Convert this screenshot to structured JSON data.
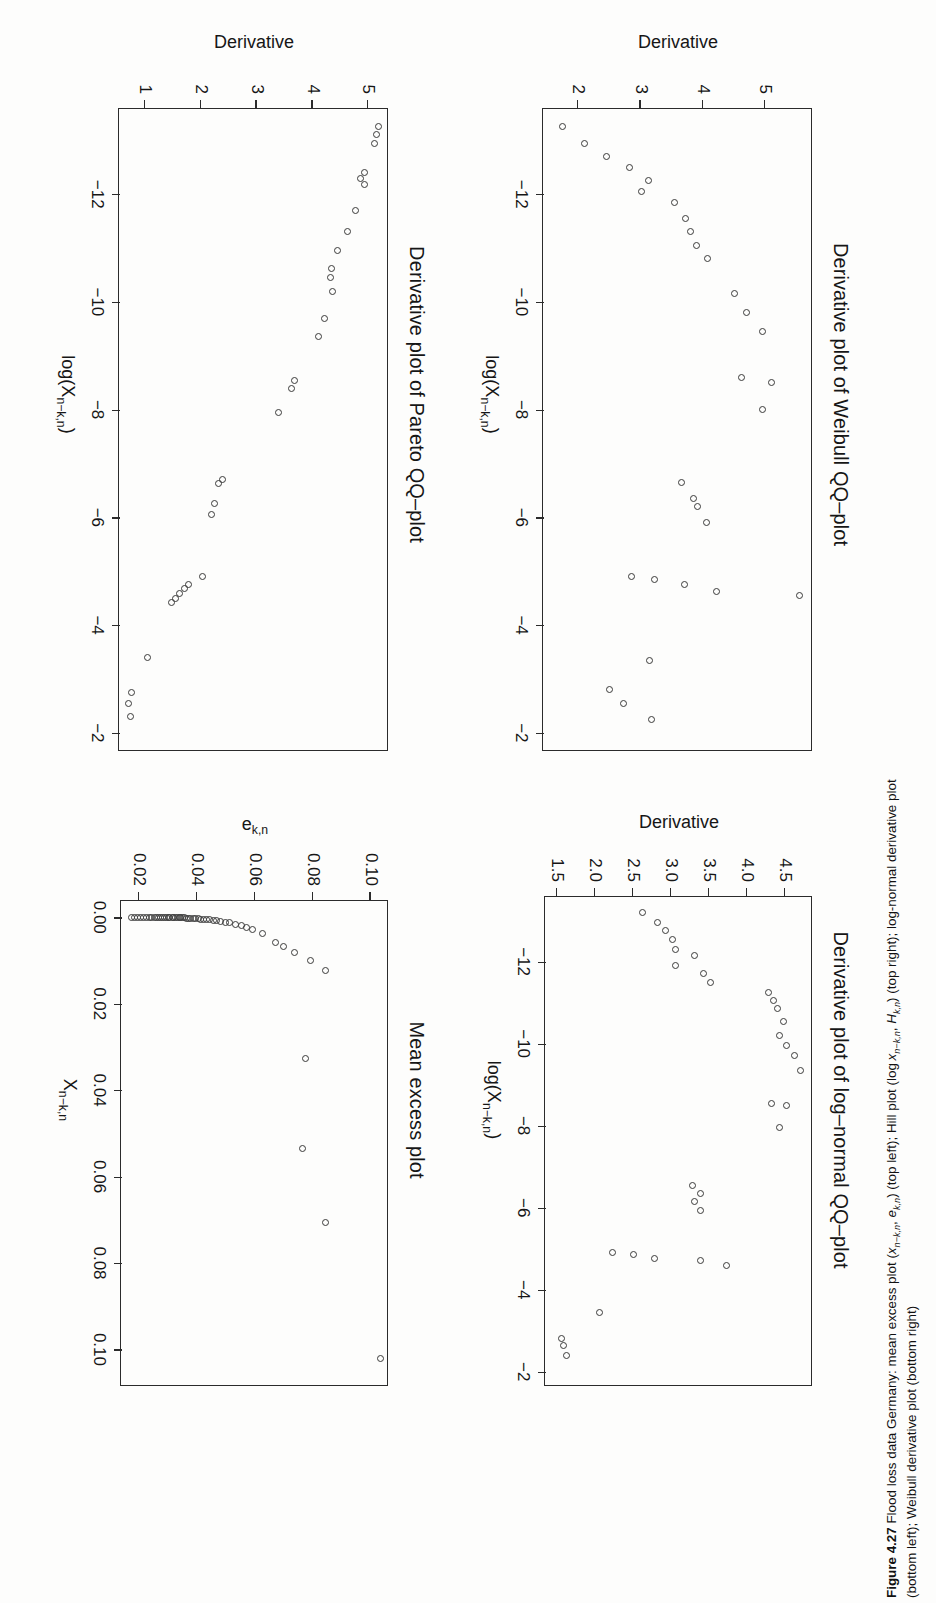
{
  "figure": {
    "caption_label": "Figure 4.27",
    "caption_line1": "Flood loss data Germany: mean excess plot (xₙ₋ₖ,ₙ, eₖ,ₙ) (top left); Hill plot (log xₙ₋ₖ,ₙ, Hₖ,ₙ) (top right); log-normal derivative plot",
    "caption_line2": "(bottom left); Weibull derivative plot (bottom right)"
  },
  "panels": {
    "mean_excess": {
      "title": "Mean excess plot",
      "xlabel": "X",
      "xlabel_sub": "n−k,n",
      "ylabel": "e",
      "ylabel_sub": "k,n",
      "xticks": [
        "0.00",
        "0.02",
        "0.04",
        "0.06",
        "0.08",
        "0.10"
      ],
      "yticks": [
        "0.02",
        "0.04",
        "0.06",
        "0.08",
        "0.10"
      ]
    },
    "pareto": {
      "title": "Derivative plot of Pareto QQ–plot",
      "xlabel": "log(X",
      "xlabel_sub": "n−k,n",
      "xlabel_tail": ")",
      "ylabel": "Derivative",
      "xticks": [
        "−12",
        "−10",
        "−8",
        "−6",
        "−4",
        "−2"
      ],
      "yticks": [
        "1",
        "2",
        "3",
        "4",
        "5"
      ]
    },
    "lognormal": {
      "title": "Derivative plot of log–normal QQ–plot",
      "xlabel": "log(X",
      "xlabel_sub": "n−k,n",
      "xlabel_tail": ")",
      "ylabel": "Derivative",
      "xticks": [
        "−12",
        "−10",
        "−8",
        "−6",
        "−4",
        "−2"
      ],
      "yticks": [
        "1.5",
        "2.0",
        "2.5",
        "3.0",
        "3.5",
        "4.0",
        "4.5"
      ]
    },
    "weibull": {
      "title": "Derivative plot of Weibull QQ–plot",
      "xlabel": "log(X",
      "xlabel_sub": "n−k,n",
      "xlabel_tail": ")",
      "ylabel": "Derivative",
      "xticks": [
        "−12",
        "−10",
        "−8",
        "−6",
        "−4",
        "−2"
      ],
      "yticks": [
        "2",
        "3",
        "4",
        "5"
      ]
    }
  },
  "chart_data": [
    {
      "id": "mean_excess",
      "type": "scatter",
      "title": "Mean excess plot",
      "xlabel": "X_{n-k,n}",
      "ylabel": "e_{k,n}",
      "xlim": [
        -0.004,
        0.108
      ],
      "ylim": [
        0.014,
        0.106
      ],
      "grid": false,
      "legend": "none",
      "xticks": [
        0.0,
        0.02,
        0.04,
        0.06,
        0.08,
        0.1
      ],
      "yticks": [
        0.02,
        0.04,
        0.06,
        0.08,
        0.1
      ],
      "points": [
        [
          0.102,
          0.1035
        ],
        [
          0.0707,
          0.0843
        ],
        [
          0.0535,
          0.0765
        ],
        [
          0.0327,
          0.0775
        ],
        [
          0.0122,
          0.0845
        ],
        [
          0.0101,
          0.0792
        ],
        [
          0.0082,
          0.0737
        ],
        [
          0.0068,
          0.07
        ],
        [
          0.0058,
          0.0672
        ],
        [
          0.0037,
          0.0625
        ],
        [
          0.0029,
          0.059
        ],
        [
          0.0024,
          0.057
        ],
        [
          0.002,
          0.0553
        ],
        [
          0.0016,
          0.0533
        ],
        [
          0.0013,
          0.0512
        ],
        [
          0.0011,
          0.0497
        ],
        [
          0.0009,
          0.0482
        ],
        [
          0.0008,
          0.0468
        ],
        [
          0.0007,
          0.0455
        ],
        [
          0.0006,
          0.0443
        ],
        [
          0.00052,
          0.0432
        ],
        [
          0.00046,
          0.0421
        ],
        [
          0.0004,
          0.0412
        ],
        [
          0.00035,
          0.0403
        ],
        [
          0.00031,
          0.0394
        ],
        [
          0.00027,
          0.0386
        ],
        [
          0.00024,
          0.0378
        ],
        [
          0.00021,
          0.0371
        ],
        [
          0.00018,
          0.0364
        ],
        [
          0.00016,
          0.0357
        ],
        [
          0.00014,
          0.035
        ],
        [
          0.00012,
          0.0344
        ],
        [
          0.0001,
          0.0338
        ],
        [
          9e-05,
          0.0331
        ],
        [
          8e-05,
          0.0325
        ],
        [
          7e-05,
          0.0319
        ],
        [
          6e-05,
          0.0313
        ],
        [
          5e-05,
          0.0306
        ],
        [
          4e-05,
          0.03
        ],
        [
          4e-05,
          0.0293
        ],
        [
          3e-05,
          0.0287
        ],
        [
          3e-05,
          0.028
        ],
        [
          2e-05,
          0.0273
        ],
        [
          2e-05,
          0.0266
        ],
        [
          2e-05,
          0.0259
        ],
        [
          1e-05,
          0.0251
        ],
        [
          1e-05,
          0.0243
        ],
        [
          1e-05,
          0.0234
        ],
        [
          1e-05,
          0.0225
        ],
        [
          1e-05,
          0.0215
        ],
        [
          0.0,
          0.0205
        ],
        [
          0.0,
          0.0194
        ],
        [
          0.0,
          0.0183
        ],
        [
          0.0,
          0.0172
        ]
      ]
    },
    {
      "id": "pareto",
      "type": "scatter",
      "title": "Derivative plot of Pareto QQ-plot",
      "xlabel": "log(X_{n-k,n})",
      "ylabel": "Derivative",
      "xlim": [
        -13.6,
        -1.7
      ],
      "ylim": [
        0.55,
        5.35
      ],
      "grid": false,
      "legend": "none",
      "xticks": [
        -12,
        -10,
        -8,
        -6,
        -4,
        -2
      ],
      "yticks": [
        1,
        2,
        3,
        4,
        5
      ],
      "points": [
        [
          -13.25,
          5.18
        ],
        [
          -13.1,
          5.14
        ],
        [
          -12.95,
          5.1
        ],
        [
          -12.4,
          4.93
        ],
        [
          -12.3,
          4.86
        ],
        [
          -12.18,
          4.93
        ],
        [
          -11.7,
          4.76
        ],
        [
          -11.3,
          4.62
        ],
        [
          -10.95,
          4.45
        ],
        [
          -10.62,
          4.34
        ],
        [
          -10.45,
          4.32
        ],
        [
          -10.2,
          4.36
        ],
        [
          -9.7,
          4.21
        ],
        [
          -9.35,
          4.1
        ],
        [
          -8.55,
          3.68
        ],
        [
          -8.4,
          3.62
        ],
        [
          -7.95,
          3.39
        ],
        [
          -6.7,
          2.38
        ],
        [
          -6.62,
          2.32
        ],
        [
          -6.25,
          2.25
        ],
        [
          -6.05,
          2.18
        ],
        [
          -4.9,
          2.02
        ],
        [
          -4.75,
          1.78
        ],
        [
          -4.68,
          1.7
        ],
        [
          -4.58,
          1.62
        ],
        [
          -4.5,
          1.55
        ],
        [
          -4.42,
          1.48
        ],
        [
          -3.4,
          1.05
        ],
        [
          -2.75,
          0.75
        ],
        [
          -2.55,
          0.7
        ],
        [
          -2.3,
          0.73
        ]
      ]
    },
    {
      "id": "lognormal",
      "type": "scatter",
      "title": "Derivative plot of log-normal QQ-plot",
      "xlabel": "log(X_{n-k,n})",
      "ylabel": "Derivative",
      "xlim": [
        -13.6,
        -1.7
      ],
      "ylim": [
        1.35,
        4.85
      ],
      "grid": false,
      "legend": "none",
      "xticks": [
        -12,
        -10,
        -8,
        -6,
        -4,
        -2
      ],
      "yticks": [
        1.5,
        2.0,
        2.5,
        3.0,
        3.5,
        4.0,
        4.5
      ],
      "points": [
        [
          -13.2,
          2.62
        ],
        [
          -12.95,
          2.82
        ],
        [
          -12.75,
          2.92
        ],
        [
          -12.55,
          3.02
        ],
        [
          -12.3,
          3.05
        ],
        [
          -12.15,
          3.3
        ],
        [
          -11.9,
          3.05
        ],
        [
          -11.7,
          3.42
        ],
        [
          -11.5,
          3.52
        ],
        [
          -11.25,
          4.28
        ],
        [
          -11.05,
          4.35
        ],
        [
          -10.85,
          4.4
        ],
        [
          -10.55,
          4.48
        ],
        [
          -10.2,
          4.42
        ],
        [
          -9.95,
          4.52
        ],
        [
          -9.7,
          4.62
        ],
        [
          -9.35,
          4.7
        ],
        [
          -8.55,
          4.32
        ],
        [
          -8.5,
          4.52
        ],
        [
          -7.95,
          4.42
        ],
        [
          -6.55,
          3.28
        ],
        [
          -6.35,
          3.38
        ],
        [
          -6.15,
          3.3
        ],
        [
          -5.92,
          3.38
        ],
        [
          -4.9,
          2.22
        ],
        [
          -4.85,
          2.5
        ],
        [
          -4.75,
          2.78
        ],
        [
          -4.7,
          3.38
        ],
        [
          -4.6,
          3.72
        ],
        [
          -3.45,
          2.05
        ],
        [
          -2.8,
          1.55
        ],
        [
          -2.65,
          1.58
        ],
        [
          -2.4,
          1.62
        ]
      ]
    },
    {
      "id": "weibull",
      "type": "scatter",
      "title": "Derivative plot of Weibull QQ-plot",
      "xlabel": "log(X_{n-k,n})",
      "ylabel": "Derivative",
      "xlim": [
        -13.6,
        -1.7
      ],
      "ylim": [
        1.45,
        5.75
      ],
      "grid": false,
      "legend": "none",
      "xticks": [
        -12,
        -10,
        -8,
        -6,
        -4,
        -2
      ],
      "yticks": [
        2,
        3,
        4,
        5
      ],
      "points": [
        [
          -13.25,
          1.75
        ],
        [
          -12.95,
          2.1
        ],
        [
          -12.7,
          2.45
        ],
        [
          -12.5,
          2.82
        ],
        [
          -12.25,
          3.12
        ],
        [
          -12.05,
          3.02
        ],
        [
          -11.85,
          3.55
        ],
        [
          -11.55,
          3.72
        ],
        [
          -11.3,
          3.8
        ],
        [
          -11.05,
          3.9
        ],
        [
          -10.8,
          4.08
        ],
        [
          -10.15,
          4.5
        ],
        [
          -9.8,
          4.7
        ],
        [
          -9.45,
          4.95
        ],
        [
          -8.6,
          4.62
        ],
        [
          -8.5,
          5.1
        ],
        [
          -8.0,
          4.95
        ],
        [
          -6.65,
          3.65
        ],
        [
          -6.35,
          3.85
        ],
        [
          -6.2,
          3.92
        ],
        [
          -5.9,
          4.05
        ],
        [
          -4.9,
          2.85
        ],
        [
          -4.85,
          3.22
        ],
        [
          -4.75,
          3.7
        ],
        [
          -4.62,
          4.22
        ],
        [
          -4.55,
          5.55
        ],
        [
          -3.35,
          3.15
        ],
        [
          -2.8,
          2.5
        ],
        [
          -2.55,
          2.72
        ],
        [
          -2.25,
          3.18
        ]
      ]
    }
  ]
}
